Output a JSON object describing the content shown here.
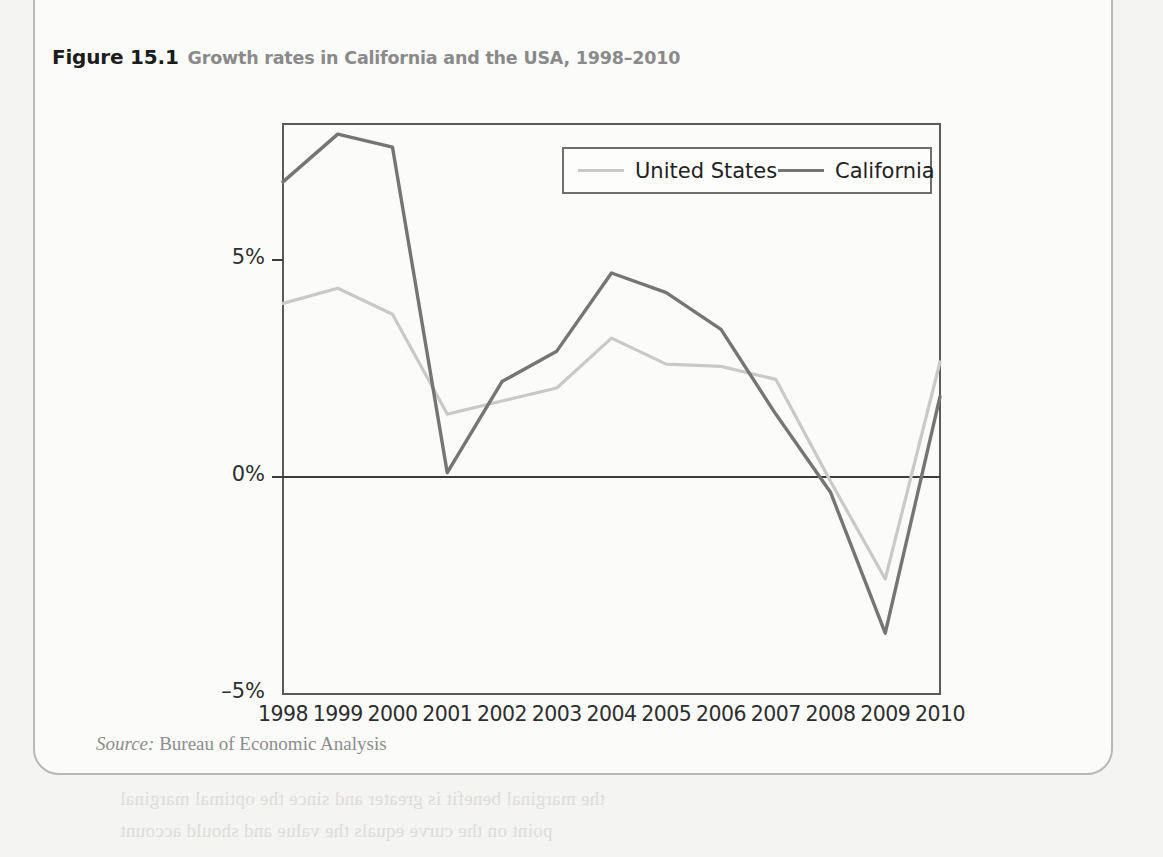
{
  "figure": {
    "number": "Figure 15.1",
    "caption": "Growth rates in California and the USA, 1998–2010",
    "source_label": "Source:",
    "source_text": "Bureau of Economic Analysis"
  },
  "colors": {
    "united_states_line": "#c9c9c9",
    "california_line": "#757575",
    "axis": "#4a4a4a",
    "plot_border": "#5a5a5a",
    "page_background": "#f4f4f2",
    "figure_background": "#fbfbfa",
    "title_number": "#1c1c1c",
    "title_caption": "#8a8a8a",
    "source": "#8d8d8d"
  },
  "chart_data": {
    "type": "line",
    "title": "Growth rates in California and the USA, 1998–2010",
    "xlabel": "",
    "ylabel": "",
    "x": [
      1998,
      1999,
      2000,
      2001,
      2002,
      2003,
      2004,
      2005,
      2006,
      2007,
      2008,
      2009,
      2010
    ],
    "categories": [
      "1998",
      "1999",
      "2000",
      "2001",
      "2002",
      "2003",
      "2004",
      "2005",
      "2006",
      "2007",
      "2008",
      "2009",
      "2010"
    ],
    "ytick_labels": [
      "5%",
      "0%",
      "–5%"
    ],
    "ytick_values": [
      5,
      0,
      -5
    ],
    "ylim": [
      -5.0,
      8.15
    ],
    "xlim": [
      1998,
      2010
    ],
    "grid": false,
    "zero_line": true,
    "legend_position": "top-right inside plot",
    "series": [
      {
        "name": "United States",
        "color": "#c9c9c9",
        "values": [
          4.0,
          4.35,
          3.75,
          1.45,
          1.75,
          2.05,
          3.2,
          2.6,
          2.55,
          2.25,
          -0.1,
          -2.35,
          2.65
        ]
      },
      {
        "name": "California",
        "color": "#757575",
        "values": [
          6.8,
          7.9,
          7.6,
          0.1,
          2.2,
          2.9,
          4.7,
          4.25,
          3.4,
          1.45,
          -0.35,
          -3.6,
          1.85
        ]
      }
    ]
  },
  "bleed_lines": [
    {
      "text": "equals the growth rate of the output of the total",
      "x": 560,
      "y": 42
    },
    {
      "text": "Margin of the product",
      "x": 300,
      "y": 160
    },
    {
      "text": "Marginal revenues",
      "x": 430,
      "y": 222
    },
    {
      "text": "the marginal cost",
      "x": 470,
      "y": 258
    },
    {
      "text": "Magnum program",
      "x": 240,
      "y": 330
    },
    {
      "text": "Optimization",
      "x": 430,
      "y": 530
    },
    {
      "text": "Available",
      "x": 600,
      "y": 530
    },
    {
      "text": "the marginal benefit is greater and since the optimal marginal",
      "x": 120,
      "y": 788
    },
    {
      "text": "point on the curve equals the value and should account",
      "x": 120,
      "y": 820
    }
  ]
}
